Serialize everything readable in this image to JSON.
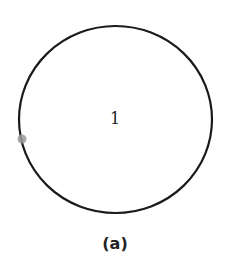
{
  "figure": {
    "caption": "(a)",
    "region_label": "1",
    "circle": {
      "cx": 115.5,
      "cy": 119.5,
      "rx": 96.5,
      "ry": 93.5,
      "stroke": "#1a1a1a",
      "stroke_width": 2.2
    },
    "marker": {
      "cx": 22,
      "cy": 139,
      "r": 4.5,
      "fill": "#9a9a9a"
    }
  }
}
